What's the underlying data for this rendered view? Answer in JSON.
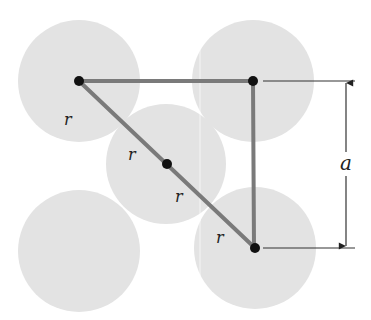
{
  "diagram": {
    "colors": {
      "background": "#ffffff",
      "atom_fill": "#e3e3e3",
      "bond_line": "#7a7a7a",
      "atom_center": "#111111",
      "dimension_line": "#333333",
      "label": "#222222"
    },
    "atoms": [
      {
        "id": "top-left",
        "cx": 79,
        "cy": 81,
        "r": 61
      },
      {
        "id": "top-right",
        "cx": 253,
        "cy": 81,
        "r": 61
      },
      {
        "id": "center",
        "cx": 166,
        "cy": 164,
        "r": 60
      },
      {
        "id": "bottom-left",
        "cx": 79,
        "cy": 251,
        "r": 61
      },
      {
        "id": "bottom-right",
        "cx": 255,
        "cy": 248,
        "r": 61
      }
    ],
    "labels": {
      "radius_label_1": "r",
      "radius_label_2": "r",
      "radius_label_3": "r",
      "radius_label_4": "r",
      "lattice_label": "a"
    }
  }
}
